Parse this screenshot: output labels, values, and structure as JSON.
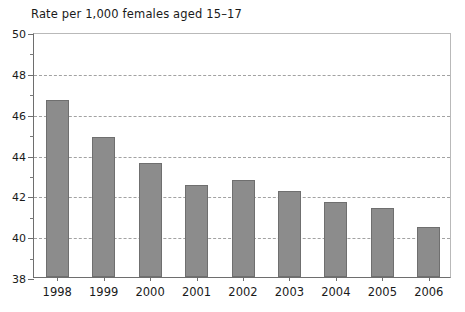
{
  "chart_data": {
    "type": "bar",
    "title": "Rate per 1,000 females aged 15–17",
    "xlabel": "",
    "ylabel": "",
    "categories": [
      "1998",
      "1999",
      "2000",
      "2001",
      "2002",
      "2003",
      "2004",
      "2005",
      "2006"
    ],
    "values": [
      46.65,
      44.85,
      43.6,
      42.5,
      42.75,
      42.2,
      41.65,
      41.4,
      40.45
    ],
    "ylim": [
      38,
      50
    ],
    "y_major_ticks": [
      38,
      40,
      42,
      44,
      46,
      48,
      50
    ],
    "y_minor_ticks": [
      39,
      41,
      43,
      45,
      47,
      49
    ],
    "y_tick_labels": [
      "38",
      "40",
      "42",
      "44",
      "46",
      "48",
      "50"
    ],
    "gridlines": [
      40,
      42,
      44,
      46,
      48
    ],
    "grid": true,
    "legend": null,
    "bar_color": "#8c8c8c",
    "bar_edge_color": "#6f6f6f",
    "gridline_color": "#a2a2a2",
    "axis_color": "#6e6e6e",
    "frame_color": "#b9b9b9",
    "background": "#ffffff",
    "text_color": "#1a1a1a"
  }
}
